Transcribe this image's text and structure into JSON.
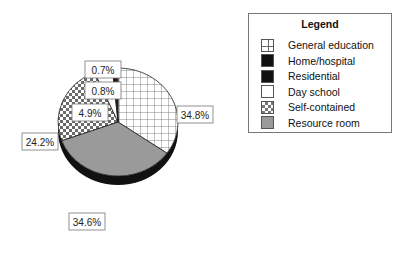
{
  "chart_data": {
    "type": "pie",
    "title": "",
    "style": "3d",
    "slices": [
      {
        "label": "General education",
        "value": 34.8,
        "display": "34.8%",
        "fill": "grid",
        "color": "#ffffff"
      },
      {
        "label": "Resource room",
        "value": 34.6,
        "display": "34.6%",
        "fill": "solid",
        "color": "#9a9a9a"
      },
      {
        "label": "Self-contained",
        "value": 24.2,
        "display": "24.2%",
        "fill": "checker",
        "color": "#777777"
      },
      {
        "label": "Day school",
        "value": 4.9,
        "display": "4.9%",
        "fill": "solid",
        "color": "#ffffff"
      },
      {
        "label": "Residential",
        "value": 0.8,
        "display": "0.8%",
        "fill": "solid",
        "color": "#111111"
      },
      {
        "label": "Home/hospital",
        "value": 0.7,
        "display": "0.7%",
        "fill": "solid",
        "color": "#111111"
      }
    ],
    "legend": {
      "title": "Legend",
      "position": "top-right",
      "items": [
        {
          "label": "General education",
          "fill": "grid"
        },
        {
          "label": "Home/hospital",
          "fill": "solid-black"
        },
        {
          "label": "Residential",
          "fill": "solid-black"
        },
        {
          "label": "Day school",
          "fill": "white"
        },
        {
          "label": "Self-contained",
          "fill": "checker"
        },
        {
          "label": "Resource room",
          "fill": "gray"
        }
      ]
    }
  }
}
